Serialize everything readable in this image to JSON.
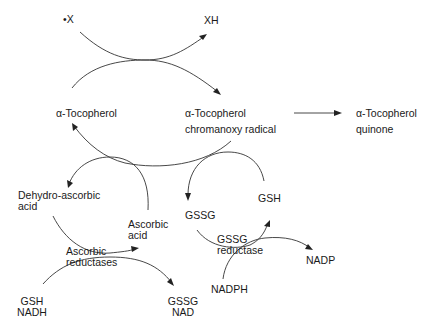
{
  "diagram": {
    "type": "metabolic-pathway",
    "nodes": {
      "x_radical": "•X",
      "xh": "XH",
      "tocopherol": "α-Tocopherol",
      "radical_line1": "α-Tocopherol",
      "radical_line2": "chromanoxy radical",
      "quinone_line1": "α-Tocopherol",
      "quinone_line2": "quinone",
      "dehydro_line1": "Dehydro-ascorbic",
      "dehydro_line2": "acid",
      "ascorbic_line1": "Ascorbic",
      "ascorbic_line2": "acid",
      "gssg": "GSSG",
      "gsh": "GSH",
      "asc_red_line1": "Ascorbic",
      "asc_red_line2": "reductases",
      "gssg_red_line1": "GSSG",
      "gssg_red_line2": "reductase",
      "gsh_nadh_line1": "GSH",
      "gsh_nadh_line2": "NADH",
      "gssg_nad_line1": "GSSG",
      "gssg_nad_line2": "NAD",
      "nadph": "NADPH",
      "nadp": "NADP"
    },
    "edges": [
      {
        "from": "•X",
        "to": "XH"
      },
      {
        "from": "α-Tocopherol",
        "to": "α-Tocopherol chromanoxy radical"
      },
      {
        "from": "α-Tocopherol chromanoxy radical",
        "to": "α-Tocopherol quinone"
      },
      {
        "from": "α-Tocopherol chromanoxy radical",
        "to": "α-Tocopherol"
      },
      {
        "from": "Ascorbic acid",
        "to": "Dehydro-ascorbic acid"
      },
      {
        "from": "Dehydro-ascorbic acid",
        "to": "Ascorbic acid",
        "enzyme": "Ascorbic reductases"
      },
      {
        "from": "GSH NADH",
        "to": "GSSG NAD"
      },
      {
        "from": "GSH",
        "to": "GSSG"
      },
      {
        "from": "GSSG",
        "to": "GSH",
        "enzyme": "GSSG reductase"
      },
      {
        "from": "NADPH",
        "to": "NADP"
      }
    ]
  }
}
